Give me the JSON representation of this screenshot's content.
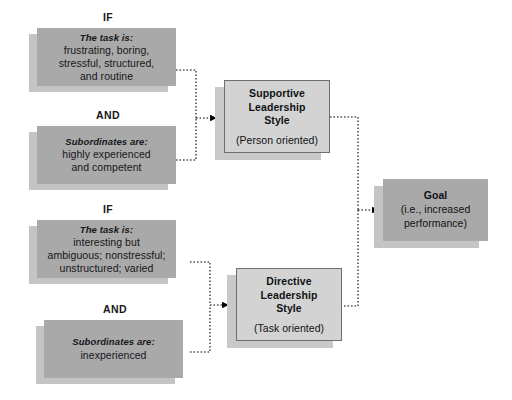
{
  "diagram": {
    "colors": {
      "box_fill": "#a9a9a9",
      "box_shadow": "#c4c4c4",
      "style_fill": "#d3d3d3",
      "style_border": "#6f6f6f",
      "connector": "#000000",
      "background": "#ffffff"
    },
    "conjunctions": [
      {
        "id": "if-1",
        "label": "IF"
      },
      {
        "id": "and-1",
        "label": "AND"
      },
      {
        "id": "if-2",
        "label": "IF"
      },
      {
        "id": "and-2",
        "label": "AND"
      }
    ],
    "conditions": [
      {
        "id": "task-supportive",
        "lead": "The task is:",
        "text": "frustrating, boring,\nstressful, structured,\nand routine"
      },
      {
        "id": "subordinates-supportive",
        "lead": "Subordinates are:",
        "text": "highly experienced\nand competent"
      },
      {
        "id": "task-directive",
        "lead": "The task is:",
        "text": "interesting but\nambiguous; nonstressful;\nunstructured; varied"
      },
      {
        "id": "subordinates-directive",
        "lead": "Subordinates are:",
        "text": "inexperienced"
      }
    ],
    "styles": [
      {
        "id": "supportive",
        "title": "Supportive\nLeadership\nStyle",
        "subtitle": "(Person oriented)"
      },
      {
        "id": "directive",
        "title": "Directive\nLeadership\nStyle",
        "subtitle": "(Task oriented)"
      }
    ],
    "goal": {
      "id": "goal",
      "title": "Goal",
      "subtitle": "(i.e., increased\nperformance)"
    }
  }
}
